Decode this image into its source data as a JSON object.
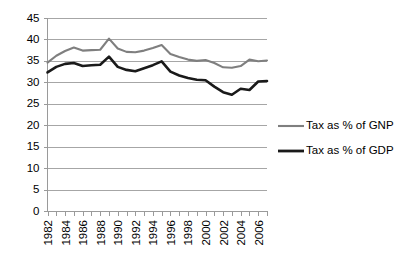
{
  "chart_data": {
    "type": "line",
    "title": "",
    "xlabel": "",
    "ylabel": "",
    "ylim": [
      0,
      45
    ],
    "ytick_step": 5,
    "yticks": [
      45,
      40,
      35,
      30,
      25,
      20,
      15,
      10,
      5,
      0
    ],
    "grid": true,
    "legend_position": "right",
    "x": [
      1982,
      1983,
      1984,
      1985,
      1986,
      1987,
      1988,
      1989,
      1990,
      1991,
      1992,
      1993,
      1994,
      1995,
      1996,
      1997,
      1998,
      1999,
      2000,
      2001,
      2002,
      2003,
      2004,
      2005,
      2006,
      2007
    ],
    "xtick_labels": [
      "1982",
      "1984",
      "1986",
      "1988",
      "1990",
      "1992",
      "1994",
      "1996",
      "1998",
      "2000",
      "2002",
      "2004",
      "2006"
    ],
    "series": [
      {
        "name": "Tax as % of GNP",
        "color": "#7f7f7f",
        "values": [
          34.6,
          36.2,
          37.3,
          38.1,
          37.4,
          37.5,
          37.6,
          40.2,
          37.9,
          37.1,
          37.0,
          37.4,
          38.0,
          38.7,
          36.6,
          35.9,
          35.3,
          35.0,
          35.2,
          34.5,
          33.5,
          33.4,
          33.8,
          35.3,
          34.9,
          35.1
        ]
      },
      {
        "name": "Tax as % of GDP",
        "color": "#1a1a1a",
        "values": [
          32.3,
          33.6,
          34.3,
          34.5,
          33.8,
          34.0,
          34.1,
          36.0,
          33.6,
          32.9,
          32.6,
          33.3,
          34.0,
          34.9,
          32.5,
          31.6,
          31.0,
          30.6,
          30.5,
          29.0,
          27.7,
          27.1,
          28.5,
          28.2,
          30.2,
          30.3
        ]
      }
    ]
  },
  "legend": {
    "items": [
      {
        "label": "Tax as % of GNP"
      },
      {
        "label": "Tax as % of GDP"
      }
    ]
  }
}
